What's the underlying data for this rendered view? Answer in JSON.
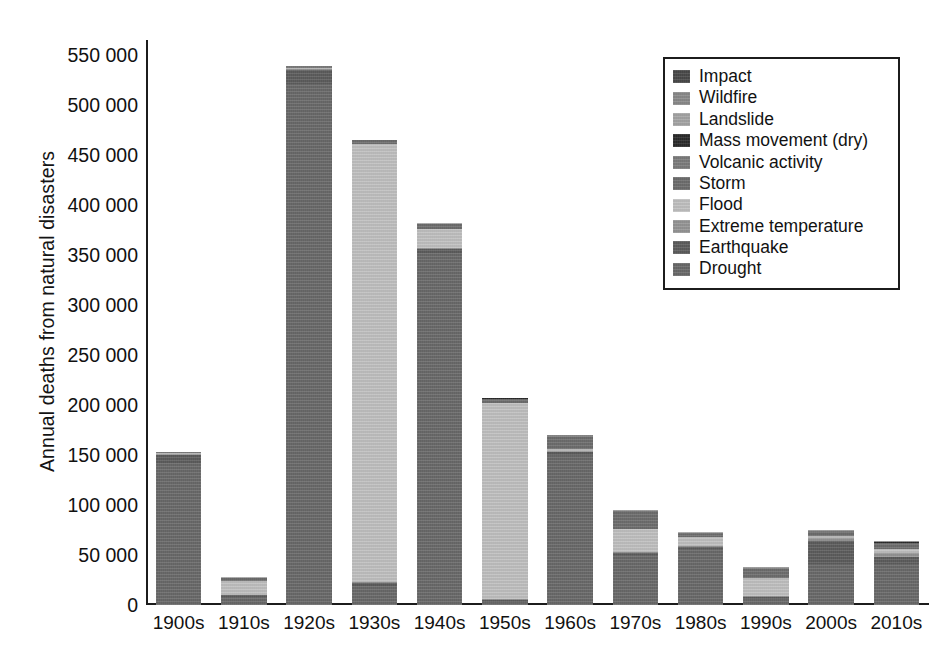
{
  "figure": {
    "background": "#ffffff",
    "axis_color": "#1c1c1c",
    "text_color": "#111111"
  },
  "axes": {
    "ylabel": "Annual deaths from natural disasters",
    "xlabel": "",
    "yticks": [
      "0",
      "50 000",
      "100 000",
      "150 000",
      "200 000",
      "250 000",
      "300 000",
      "350 000",
      "400 000",
      "450 000",
      "500 000",
      "550 000"
    ],
    "ytick_values": [
      0,
      50000,
      100000,
      150000,
      200000,
      250000,
      300000,
      350000,
      400000,
      450000,
      500000,
      550000
    ],
    "ylim": [
      0,
      565000
    ],
    "xticks": [
      "1900s",
      "1910s",
      "1920s",
      "1930s",
      "1940s",
      "1950s",
      "1960s",
      "1970s",
      "1980s",
      "1990s",
      "2000s",
      "2010s"
    ]
  },
  "legend": {
    "position": "top-right",
    "border_color": "#1c1c1c",
    "items": [
      {
        "label": "Impact",
        "color": "#4a4a4a"
      },
      {
        "label": "Wildfire",
        "color": "#8c8c8c"
      },
      {
        "label": "Landslide",
        "color": "#a8a8a8"
      },
      {
        "label": "Mass movement (dry)",
        "color": "#2b2b2b"
      },
      {
        "label": "Volcanic activity",
        "color": "#7e7e7e"
      },
      {
        "label": "Storm",
        "color": "#6f6f6f"
      },
      {
        "label": "Flood",
        "color": "#c4c4c4"
      },
      {
        "label": "Extreme temperature",
        "color": "#989898"
      },
      {
        "label": "Earthquake",
        "color": "#5e5e5e"
      },
      {
        "label": "Drought",
        "color": "#6b6b6b"
      }
    ]
  },
  "chart_data": {
    "type": "bar",
    "subtype": "stacked",
    "title": "",
    "xlabel": "",
    "ylabel": "Annual deaths from natural disasters",
    "ylim": [
      0,
      565000
    ],
    "grid": false,
    "legend_position": "top-right",
    "categories": [
      "1900s",
      "1910s",
      "1920s",
      "1930s",
      "1940s",
      "1950s",
      "1960s",
      "1970s",
      "1980s",
      "1990s",
      "2000s",
      "2010s"
    ],
    "stack_order_bottom_to_top": [
      "Drought",
      "Earthquake",
      "Extreme temperature",
      "Flood",
      "Storm",
      "Volcanic activity",
      "Mass movement (dry)",
      "Landslide",
      "Wildfire",
      "Impact"
    ],
    "series": [
      {
        "name": "Drought",
        "color": "#6b6b6b",
        "values": [
          142000,
          8000,
          521000,
          19000,
          352000,
          3000,
          150000,
          50000,
          56000,
          6000,
          41000,
          41000
        ]
      },
      {
        "name": "Earthquake",
        "color": "#5e5e5e",
        "values": [
          8000,
          2000,
          14000,
          3000,
          4000,
          2000,
          3000,
          2000,
          2000,
          2000,
          23000,
          7000
        ]
      },
      {
        "name": "Extreme temperature",
        "color": "#989898",
        "values": [
          1000,
          500,
          800,
          600,
          900,
          600,
          900,
          600,
          1000,
          1500,
          3000,
          4000
        ]
      },
      {
        "name": "Flood",
        "color": "#c4c4c4",
        "values": [
          800,
          14000,
          1500,
          438000,
          19000,
          196000,
          2500,
          23000,
          9000,
          18000,
          2500,
          4000
        ]
      },
      {
        "name": "Storm",
        "color": "#6f6f6f",
        "values": [
          500,
          2500,
          1200,
          4000,
          5000,
          4500,
          12000,
          18000,
          3500,
          9000,
          4000,
          6000
        ]
      },
      {
        "name": "Volcanic activity",
        "color": "#7e7e7e",
        "values": [
          300,
          400,
          300,
          300,
          400,
          400,
          400,
          400,
          400,
          500,
          500,
          500
        ]
      },
      {
        "name": "Mass movement (dry)",
        "color": "#2b2b2b",
        "values": [
          100,
          100,
          100,
          100,
          100,
          100,
          100,
          100,
          100,
          100,
          100,
          100
        ]
      },
      {
        "name": "Landslide",
        "color": "#a8a8a8",
        "values": [
          200,
          300,
          200,
          300,
          400,
          400,
          500,
          600,
          600,
          700,
          800,
          900
        ]
      },
      {
        "name": "Wildfire",
        "color": "#8c8c8c",
        "values": [
          100,
          100,
          100,
          100,
          100,
          200,
          200,
          200,
          200,
          300,
          300,
          400
        ]
      },
      {
        "name": "Impact",
        "color": "#4a4a4a",
        "values": [
          100,
          100,
          100,
          100,
          100,
          100,
          100,
          100,
          100,
          100,
          100,
          100
        ]
      }
    ],
    "totals": [
      153100,
      28000,
      539300,
      465500,
      382000,
      207300,
      169700,
      95000,
      72900,
      38200,
      75300,
      64000
    ]
  }
}
